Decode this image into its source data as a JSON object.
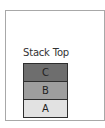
{
  "diagram": {
    "title": "Stack Top",
    "blocks": [
      {
        "label": "C",
        "color": "#6e6e6e"
      },
      {
        "label": "B",
        "color": "#9e9e9e"
      },
      {
        "label": "A",
        "color": "#e2e2e2"
      }
    ]
  }
}
